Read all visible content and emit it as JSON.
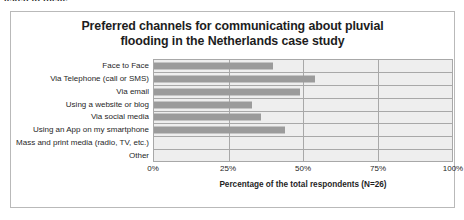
{
  "clipped_text": "listen to them.",
  "chart_data": {
    "type": "bar",
    "orientation": "horizontal",
    "title": "Preferred channels for communicating about pluvial flooding in the Netherlands case study",
    "title_lines": [
      "Preferred channels for communicating about pluvial",
      "flooding in the Netherlands case study"
    ],
    "categories": [
      "Face to Face",
      "Via Telephone (call or SMS)",
      "Via email",
      "Using a website or blog",
      "Via social media",
      "Using an App on my smartphone",
      "Mass and print media (radio, TV, etc.)",
      "Other"
    ],
    "values": [
      40,
      54,
      49,
      33,
      36,
      44,
      0,
      0
    ],
    "xlabel": "Percentage of the total respondents (N=26)",
    "ylabel": "",
    "xlim": [
      0,
      100
    ],
    "xticks": [
      "0%",
      "25%",
      "50%",
      "75%",
      "100%"
    ],
    "xtick_values": [
      0,
      25,
      50,
      75,
      100
    ],
    "grid": "vertical-and-horizontal",
    "legend": "none",
    "bar_color": "#9b9b9b",
    "plot_background": "#eeeeee",
    "axis_color": "#a8a8a8"
  }
}
